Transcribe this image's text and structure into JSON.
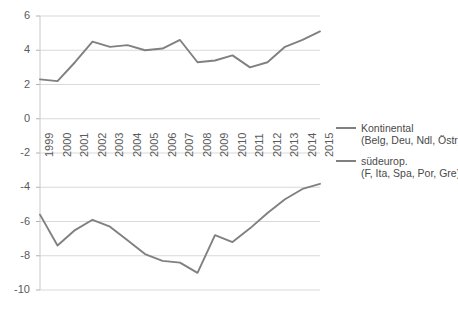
{
  "chart_data": {
    "type": "line",
    "title": "",
    "subtitle": "",
    "xlabel": "",
    "ylabel": "",
    "grid": true,
    "legend_position": "right",
    "xlim": [
      1999,
      2015
    ],
    "ylim": [
      -10,
      6
    ],
    "ytick_labels": [
      "6",
      "4",
      "2",
      "0",
      "-2",
      "-4",
      "-6",
      "-8",
      "-10"
    ],
    "ytick_values": [
      6,
      4,
      2,
      0,
      -2,
      -4,
      -6,
      -8,
      -10
    ],
    "categories": [
      "1999",
      "2000",
      "2001",
      "2002",
      "2003",
      "2004",
      "2005",
      "2006",
      "2007",
      "2008",
      "2009",
      "2010",
      "2011",
      "2012",
      "2013",
      "2014",
      "2015"
    ],
    "x": [
      1999,
      2000,
      2001,
      2002,
      2003,
      2004,
      2005,
      2006,
      2007,
      2008,
      2009,
      2010,
      2011,
      2012,
      2013,
      2014,
      2015
    ],
    "series": [
      {
        "name": "Kontinental",
        "detail": "(Belg, Deu, Ndl, Östr)",
        "color": "#808080",
        "values": [
          2.3,
          2.2,
          3.3,
          4.5,
          4.2,
          4.3,
          4.0,
          4.1,
          4.6,
          3.3,
          3.4,
          3.7,
          3.0,
          3.3,
          4.2,
          4.6,
          5.1
        ]
      },
      {
        "name": "südeurop.",
        "detail": "(F, Ita, Spa, Por, Gre)",
        "color": "#808080",
        "values": [
          -5.6,
          -7.4,
          -6.5,
          -5.9,
          -6.3,
          -7.1,
          -7.9,
          -8.3,
          -8.4,
          -9.0,
          -6.8,
          -7.2,
          -6.4,
          -5.5,
          -4.7,
          -4.1,
          -3.8
        ]
      }
    ]
  },
  "legend": {
    "entries": [
      {
        "label": "Kontinental",
        "detail": "(Belg, Deu, Ndl, Östr)"
      },
      {
        "label": "südeurop.",
        "detail": "(F, Ita, Spa, Por, Gre)"
      }
    ]
  }
}
